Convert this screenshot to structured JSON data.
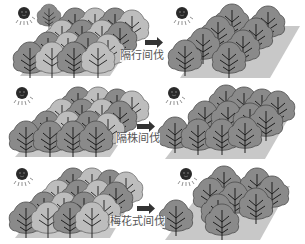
{
  "colors": {
    "background": "#ffffff",
    "ground": "#c8c8c8",
    "tree_kept": "#8a8a8a",
    "tree_cut": "#bdbdbd",
    "tree_outline": "#4a4a4a",
    "trunk": "#1e1e1e",
    "sun": "#2a2a2a",
    "arrow": "#333333",
    "label_text": "#555555"
  },
  "rows": [
    {
      "method": "row-thinning",
      "label": "隔行间伐",
      "description": "Alternate rows removed"
    },
    {
      "method": "tree-thinning",
      "label": "隔株间伐",
      "description": "Alternate trees removed"
    },
    {
      "method": "quincunx-thinning",
      "label": "梅花式间伐",
      "description": "Plum-blossom (quincunx) pattern removal"
    }
  ],
  "icons": {
    "sun": "sun-icon",
    "arrow": "arrow-right-icon"
  }
}
